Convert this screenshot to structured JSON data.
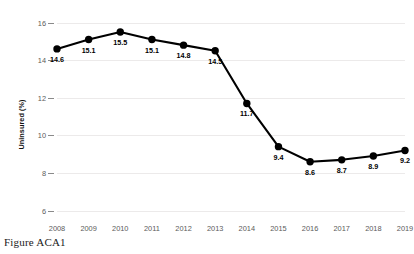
{
  "caption": "Figure ACA1",
  "chart_data": {
    "type": "line",
    "title": "",
    "xlabel": "",
    "ylabel": "Uninsured (%)",
    "categories": [
      "2008",
      "2009",
      "2010",
      "2011",
      "2012",
      "2013",
      "2014",
      "2015",
      "2016",
      "2017",
      "2018",
      "2019"
    ],
    "values": [
      14.6,
      15.1,
      15.5,
      15.1,
      14.8,
      14.5,
      11.7,
      9.4,
      8.6,
      8.7,
      8.9,
      9.2
    ],
    "point_labels": [
      "14.6",
      "15.1",
      "15.5",
      "15.1",
      "14.8",
      "14.5",
      "11.7",
      "9.4",
      "8.6",
      "8.7",
      "8.9",
      "9.2"
    ],
    "ylim": [
      5.5,
      16.35
    ],
    "yticks": [
      6,
      8,
      10,
      12,
      14,
      16
    ],
    "ytick_labels": [
      "6",
      "8",
      "10",
      "12",
      "14",
      "16"
    ],
    "grid": true,
    "legend": "none",
    "series_color": "#000000",
    "grid_color": "#eceaea",
    "tick_color": "#5b5b5b",
    "marker": "circle"
  }
}
